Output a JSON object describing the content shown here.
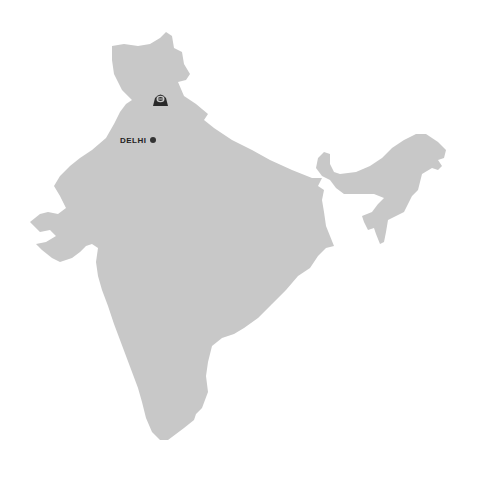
{
  "map": {
    "region": "India",
    "fill_color": "#c8c8c8",
    "background": "#ffffff"
  },
  "cities": [
    {
      "label": "DELHI",
      "marker": "dot",
      "color": "#333333"
    }
  ],
  "pins": [
    {
      "icon": "landmark-badge-icon",
      "color": "#2a2a2a"
    }
  ]
}
